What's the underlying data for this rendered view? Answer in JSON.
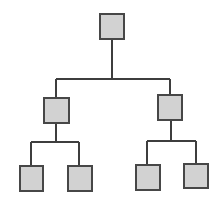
{
  "diagram": {
    "type": "tree",
    "colors": {
      "node_fill": "#d2d2d2",
      "node_border": "#474747",
      "edge": "#3e3e3e"
    },
    "nodes": [
      {
        "id": "root",
        "label": "",
        "parent": null
      },
      {
        "id": "left",
        "label": "",
        "parent": "root"
      },
      {
        "id": "right",
        "label": "",
        "parent": "root"
      },
      {
        "id": "left-left",
        "label": "",
        "parent": "left"
      },
      {
        "id": "left-right",
        "label": "",
        "parent": "left"
      },
      {
        "id": "right-left",
        "label": "",
        "parent": "right"
      },
      {
        "id": "right-right",
        "label": "",
        "parent": "right"
      }
    ]
  }
}
